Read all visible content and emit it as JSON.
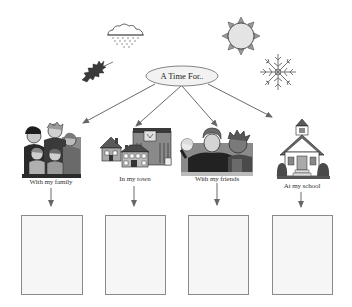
{
  "diagram": {
    "title_display": "A Time For..",
    "colors": {
      "line": "#6a6a6a",
      "box_border": "#8a8a8a",
      "box_fill": "#f6f6f6",
      "ellipse_fill": "#f2f2f2",
      "ellipse_border": "#777777"
    },
    "season_icons": [
      {
        "name": "rain-cloud-icon",
        "meaning": "spring/rain"
      },
      {
        "name": "autumn-leaf-icon",
        "meaning": "fall"
      },
      {
        "name": "sun-icon",
        "meaning": "summer"
      },
      {
        "name": "snowflake-icon",
        "meaning": "winter"
      }
    ],
    "branches": [
      {
        "id": "family",
        "label": "With my family",
        "picture": "family-picture"
      },
      {
        "id": "town",
        "label": "In my town",
        "picture": "town-picture"
      },
      {
        "id": "friends",
        "label": "With my friends",
        "picture": "friends-picture"
      },
      {
        "id": "school",
        "label": "At my school",
        "picture": "school-picture"
      }
    ],
    "answer_boxes": [
      {
        "id": "family-box",
        "value": ""
      },
      {
        "id": "town-box",
        "value": ""
      },
      {
        "id": "friends-box",
        "value": ""
      },
      {
        "id": "school-box",
        "value": ""
      }
    ]
  }
}
